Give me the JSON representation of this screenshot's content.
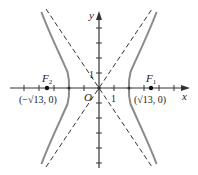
{
  "diagram": {
    "type": "hyperbola",
    "equation": "x^2/4 - y^2/9 = 1",
    "axes": {
      "x_label": "x",
      "y_label": "y",
      "origin_label": "O",
      "x_tick_label": "1",
      "y_tick_label": "1"
    },
    "foci": [
      {
        "name": "F",
        "sub": "1",
        "coord_label": "(√13, 0)"
      },
      {
        "name": "F",
        "sub": "2",
        "coord_label": "(−√13, 0)"
      }
    ],
    "asymptotes": [
      "y = 3x/2",
      "y = −3x/2"
    ],
    "colors": {
      "curve": "#8a8a8a",
      "axis": "#333333",
      "asymptote": "#333333"
    }
  }
}
